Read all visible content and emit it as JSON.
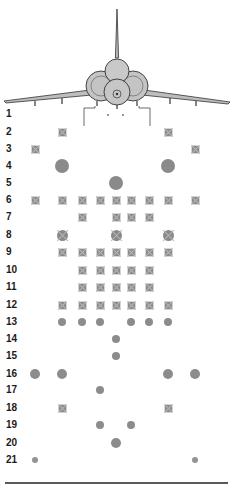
{
  "diagram": {
    "columns_x": [
      35,
      62,
      82,
      100,
      116,
      131,
      149,
      168,
      195
    ],
    "colors": {
      "marker": "#8a8a8a",
      "line": "#333333",
      "label": "#1a1a1a",
      "fill": "#c8c8c8"
    },
    "rows": [
      {
        "label": "1",
        "y": 114,
        "markers": []
      },
      {
        "label": "2",
        "y": 132,
        "markers": [
          {
            "col": 1,
            "type": "sq"
          },
          {
            "col": 7,
            "type": "sq"
          }
        ]
      },
      {
        "label": "3",
        "y": 149,
        "markers": [
          {
            "col": 0,
            "type": "sq"
          },
          {
            "col": 8,
            "type": "sq"
          }
        ]
      },
      {
        "label": "4",
        "y": 166,
        "markers": [
          {
            "col": 1,
            "type": "big"
          },
          {
            "col": 7,
            "type": "big"
          }
        ]
      },
      {
        "label": "5",
        "y": 183,
        "markers": [
          {
            "col": 4,
            "type": "big"
          }
        ]
      },
      {
        "label": "6",
        "y": 200,
        "markers": [
          {
            "col": 0,
            "type": "sq"
          },
          {
            "col": 1,
            "type": "sq"
          },
          {
            "col": 2,
            "type": "sq"
          },
          {
            "col": 3,
            "type": "sq"
          },
          {
            "col": 4,
            "type": "sq"
          },
          {
            "col": 5,
            "type": "sq"
          },
          {
            "col": 6,
            "type": "sq"
          },
          {
            "col": 7,
            "type": "sq"
          },
          {
            "col": 8,
            "type": "sq"
          }
        ]
      },
      {
        "label": "7",
        "y": 217,
        "markers": [
          {
            "col": 2,
            "type": "sq"
          },
          {
            "col": 4,
            "type": "sq"
          },
          {
            "col": 5,
            "type": "sq"
          },
          {
            "col": 6,
            "type": "sq"
          }
        ]
      },
      {
        "label": "8",
        "y": 235,
        "markers": [
          {
            "col": 1,
            "type": "sqbig"
          },
          {
            "col": 4,
            "type": "sqbig"
          },
          {
            "col": 7,
            "type": "sqbig"
          }
        ]
      },
      {
        "label": "9",
        "y": 252,
        "markers": [
          {
            "col": 1,
            "type": "sq"
          },
          {
            "col": 2,
            "type": "sq"
          },
          {
            "col": 3,
            "type": "sq"
          },
          {
            "col": 4,
            "type": "sq"
          },
          {
            "col": 5,
            "type": "sq"
          },
          {
            "col": 6,
            "type": "sq"
          },
          {
            "col": 7,
            "type": "sq"
          }
        ]
      },
      {
        "label": "10",
        "y": 270,
        "markers": [
          {
            "col": 2,
            "type": "sq"
          },
          {
            "col": 3,
            "type": "sq"
          },
          {
            "col": 4,
            "type": "sq"
          },
          {
            "col": 5,
            "type": "sq"
          },
          {
            "col": 6,
            "type": "sq"
          }
        ]
      },
      {
        "label": "11",
        "y": 287,
        "markers": [
          {
            "col": 2,
            "type": "sq"
          },
          {
            "col": 3,
            "type": "sq"
          },
          {
            "col": 4,
            "type": "sq"
          },
          {
            "col": 5,
            "type": "sq"
          },
          {
            "col": 6,
            "type": "sq"
          }
        ]
      },
      {
        "label": "12",
        "y": 305,
        "markers": [
          {
            "col": 1,
            "type": "sq"
          },
          {
            "col": 2,
            "type": "sq"
          },
          {
            "col": 3,
            "type": "sq"
          },
          {
            "col": 4,
            "type": "sq"
          },
          {
            "col": 5,
            "type": "sq"
          },
          {
            "col": 6,
            "type": "sq"
          },
          {
            "col": 7,
            "type": "sq"
          }
        ]
      },
      {
        "label": "13",
        "y": 322,
        "markers": [
          {
            "col": 1,
            "type": "dot"
          },
          {
            "col": 2,
            "type": "dot"
          },
          {
            "col": 3,
            "type": "dot"
          },
          {
            "col": 5,
            "type": "dot"
          },
          {
            "col": 6,
            "type": "dot"
          },
          {
            "col": 7,
            "type": "dot"
          }
        ]
      },
      {
        "label": "14",
        "y": 339,
        "markers": [
          {
            "col": 4,
            "type": "dot"
          }
        ]
      },
      {
        "label": "15",
        "y": 356,
        "markers": [
          {
            "col": 4,
            "type": "dot"
          }
        ]
      },
      {
        "label": "16",
        "y": 374,
        "markers": [
          {
            "col": 0,
            "type": "mid"
          },
          {
            "col": 1,
            "type": "mid"
          },
          {
            "col": 7,
            "type": "mid"
          },
          {
            "col": 8,
            "type": "mid"
          }
        ]
      },
      {
        "label": "17",
        "y": 390,
        "markers": [
          {
            "col": 3,
            "type": "dot"
          }
        ]
      },
      {
        "label": "18",
        "y": 408,
        "markers": [
          {
            "col": 1,
            "type": "sq"
          },
          {
            "col": 7,
            "type": "sq"
          }
        ]
      },
      {
        "label": "19",
        "y": 425,
        "markers": [
          {
            "col": 3,
            "type": "dot"
          },
          {
            "col": 5,
            "type": "dot"
          }
        ]
      },
      {
        "label": "20",
        "y": 443,
        "markers": [
          {
            "col": 4,
            "type": "mid"
          }
        ]
      },
      {
        "label": "21",
        "y": 460,
        "markers": [
          {
            "col": 0,
            "type": "sm"
          },
          {
            "col": 8,
            "type": "sm"
          }
        ]
      }
    ]
  }
}
